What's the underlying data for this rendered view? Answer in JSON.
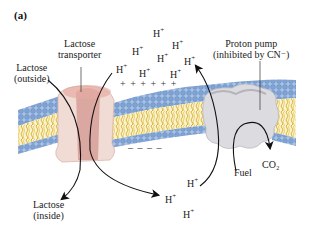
{
  "panel_label": "(a)",
  "labels": {
    "lactose_transporter": [
      "Lactose",
      "transporter"
    ],
    "lactose_outside": [
      "Lactose",
      "(outside)"
    ],
    "lactose_inside": [
      "Lactose",
      "(inside)"
    ],
    "proton_pump": [
      "Proton pump",
      "(inhibited by CN⁻)"
    ],
    "fuel": "Fuel",
    "co2": "CO₂"
  },
  "ions": {
    "symbol": "H",
    "charge": "+",
    "outside_positions": [
      {
        "x": 153,
        "y": 27
      },
      {
        "x": 172,
        "y": 39
      },
      {
        "x": 132,
        "y": 45
      },
      {
        "x": 157,
        "y": 52
      },
      {
        "x": 184,
        "y": 55
      },
      {
        "x": 116,
        "y": 63
      },
      {
        "x": 139,
        "y": 67
      },
      {
        "x": 170,
        "y": 68
      }
    ],
    "inside_positions": [
      {
        "x": 187,
        "y": 177
      },
      {
        "x": 165,
        "y": 193
      },
      {
        "x": 183,
        "y": 208
      }
    ]
  },
  "membrane_charges": {
    "outside": "+ + + + + +",
    "inside": "– – – –"
  },
  "colors": {
    "head_group": "#8fb0d8",
    "tail": "#e2c24a",
    "transporter": "#e4b5ad",
    "transporter_core": "#c98a86",
    "pump": "#d9d9dd",
    "arrow": "#111111"
  }
}
